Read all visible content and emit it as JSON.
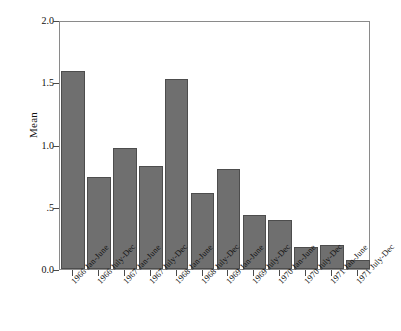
{
  "chart_data": {
    "type": "bar",
    "title": "",
    "xlabel": "",
    "ylabel": "Mean",
    "ylim": [
      0.0,
      2.0
    ],
    "grid": false,
    "legend": "none",
    "y_ticks": [
      "0.0",
      ".5",
      "1.0",
      "1.5",
      "2.0"
    ],
    "y_tick_values": [
      0.0,
      0.5,
      1.0,
      1.5,
      2.0
    ],
    "categories": [
      "1966 Jan-June",
      "1966 July-Dec",
      "1967 Jan-June",
      "1967 July-Dec",
      "1968 Jan-June",
      "1968 July-Dec",
      "1969 Jan-June",
      "1969 July-Dec",
      "1970 Jan-June",
      "1970 July-Dec",
      "1971 Jan-June",
      "1971 July-Dec"
    ],
    "values": [
      1.59,
      0.74,
      0.97,
      0.83,
      1.53,
      0.61,
      0.8,
      0.43,
      0.39,
      0.18,
      0.19,
      0.07
    ],
    "bar_color": "#6f6f6f",
    "bar_edge_color": "#4d4d4d",
    "axis_color": "#8a8a8a",
    "background_color": "#ffffff"
  }
}
